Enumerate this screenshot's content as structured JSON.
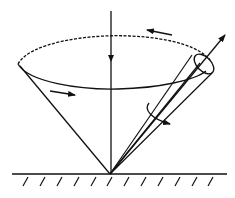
{
  "diagram": {
    "colors": {
      "stroke": "#111111",
      "background": "#ffffff"
    },
    "elements": {
      "vertical_axis": "vertical axis with downward arrow",
      "precession_cone": "large cone with elliptical rim (dashed back, solid front)",
      "spin_axis": "tilted axis with small body cone and outward arrow",
      "precession_arrows": [
        "arrow on back of rim pointing left",
        "arrow on front of rim pointing right"
      ],
      "spin_arrow": "curved rotation arrow around tilted axis",
      "ground": "hatched fixed support surface"
    }
  }
}
